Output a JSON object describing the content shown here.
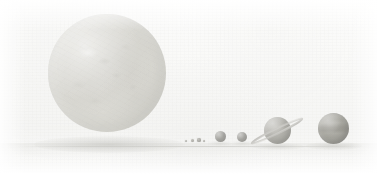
{
  "image": {
    "title": "Solar System Size Comparison",
    "description": "Faded scan of a solar system scale illustration showing the Sun and the eight planets aligned on a common ground plane, ordered left to right by position in the lineup.",
    "width_px": 377,
    "height_px": 178,
    "style": "low-contrast grayscale scan on off-white paper",
    "background_color": "#fbfbfa",
    "ground_line_color": "#bab9b5",
    "shadow_color": "#b6b6b1"
  },
  "bodies": [
    {
      "name": "Sun",
      "label": "Sun",
      "kind": "star",
      "order": 0,
      "center_x": 107,
      "center_y": 73,
      "diameter_px": 118,
      "color": "#d2d1ca",
      "features": "mottled granulation, bright limb highlight upper-left, darker patches near center"
    },
    {
      "name": "Mercury",
      "label": "Mercury",
      "kind": "terrestrial planet",
      "order": 1,
      "center_x": 186,
      "center_y": 141,
      "diameter_px": 2.2,
      "color": "#9d9c96",
      "features": "single dark dot"
    },
    {
      "name": "Venus",
      "label": "Venus",
      "kind": "terrestrial planet",
      "order": 2,
      "center_x": 192,
      "center_y": 140,
      "diameter_px": 3.0,
      "color": "#9d9c96",
      "features": "single dark dot"
    },
    {
      "name": "Earth",
      "label": "Earth",
      "kind": "terrestrial planet",
      "order": 3,
      "center_x": 199,
      "center_y": 140,
      "diameter_px": 3.2,
      "color": "#8e8d87",
      "features": "single dark dot, slightly largest of the four small dots"
    },
    {
      "name": "Mars",
      "label": "Mars",
      "kind": "terrestrial planet",
      "order": 4,
      "center_x": 204,
      "center_y": 141,
      "diameter_px": 2.4,
      "color": "#9d9c96",
      "features": "single dark dot"
    },
    {
      "name": "Uranus",
      "label": "Uranus",
      "kind": "ice giant",
      "order": 5,
      "center_x": 220,
      "center_y": 136,
      "diameter_px": 11,
      "color": "#989791",
      "features": "smooth shaded sphere with upper-left highlight"
    },
    {
      "name": "Neptune",
      "label": "Neptune",
      "kind": "ice giant",
      "order": 6,
      "center_x": 242,
      "center_y": 137,
      "diameter_px": 10.5,
      "color": "#989791",
      "features": "smooth shaded sphere with upper-left highlight"
    },
    {
      "name": "Saturn",
      "label": "Saturn",
      "kind": "gas giant",
      "order": 7,
      "center_x": 277,
      "center_y": 130,
      "diameter_px": 27,
      "color": "#a3a29b",
      "features": "banded sphere crossed by a thin edge-on ring tilted up to the right",
      "ring": {
        "present": true,
        "tilt_degrees": -26,
        "span_px": 56,
        "color": "#c6c5c0"
      }
    },
    {
      "name": "Jupiter",
      "label": "Jupiter",
      "kind": "gas giant",
      "order": 8,
      "center_x": 333,
      "center_y": 128,
      "diameter_px": 31,
      "color": "#99988f",
      "features": "largest planet, horizontal cloud bands with a dark equatorial belt"
    }
  ]
}
